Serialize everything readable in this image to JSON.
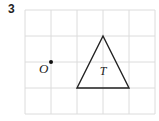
{
  "question": {
    "number": "3"
  },
  "grid": {
    "x0": 25,
    "y0": 10,
    "cell": 26,
    "cols": 5,
    "rows": 4,
    "line_color": "#dcdcdc"
  },
  "point": {
    "label": "O",
    "cx": 51,
    "cy": 62
  },
  "shape": {
    "label": "T",
    "type": "triangle",
    "vertices": [
      [
        103,
        36
      ],
      [
        77,
        88
      ],
      [
        129,
        88
      ]
    ],
    "stroke": "#222222"
  }
}
